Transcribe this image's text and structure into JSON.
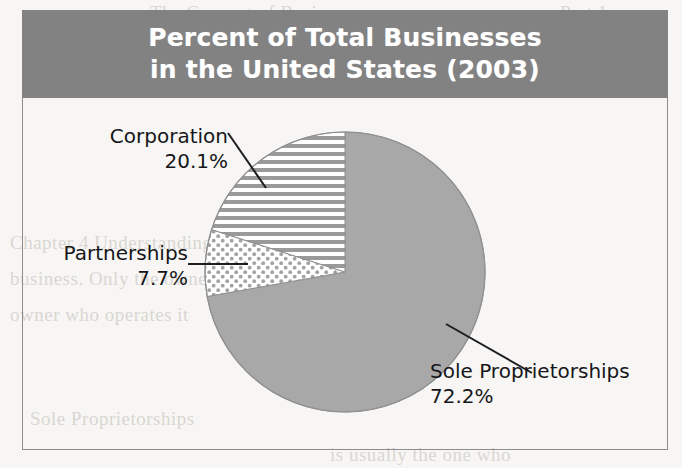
{
  "figure": {
    "title_lines": [
      "Percent of Total Businesses",
      "in the United States (2003)"
    ],
    "colors": {
      "title_bar": "#828282",
      "title_text": "#ffffff",
      "slice_gray": "#a8a8a8",
      "pattern_gray": "#9a9a9a",
      "frame": "#8d8d8d",
      "label_text": "#16161a",
      "paper": "#f7f6f4"
    }
  },
  "chart_data": {
    "type": "pie",
    "title": "Percent of Total Businesses in the United States (2003)",
    "xlabel": "",
    "ylabel": "",
    "unit": "%",
    "start_angle_deg": 0,
    "direction": "clockwise",
    "legend": "callout-labels",
    "grid": false,
    "categories": [
      "Sole Proprietorships",
      "Partnerships",
      "Corporation"
    ],
    "values": [
      72.2,
      7.7,
      20.1
    ],
    "slices": [
      {
        "label": "Sole Proprietorships",
        "value": 72.2,
        "value_text": "72.2%",
        "fill": "solid-gray",
        "color": "#a8a8a8",
        "start_deg": 0,
        "end_deg": 259.92
      },
      {
        "label": "Partnerships",
        "value": 7.7,
        "value_text": "7.7%",
        "fill": "dotted",
        "color": "#9a9a9a",
        "start_deg": 259.92,
        "end_deg": 287.64
      },
      {
        "label": "Corporation",
        "value": 20.1,
        "value_text": "20.1%",
        "fill": "horizontal-stripes",
        "color": "#9a9a9a",
        "start_deg": 287.64,
        "end_deg": 360
      }
    ]
  },
  "labels": {
    "corporation": {
      "name": "Corporation",
      "value": "20.1%"
    },
    "partnerships": {
      "name": "Partnerships",
      "value": "7.7%"
    },
    "sole": {
      "name": "Sole Proprietorships",
      "value": "72.2%"
    }
  },
  "bleed_text": [
    "The Concept of Business",
    "Part 1",
    "Chapter 4   Understanding",
    "business. Only the owner is liable for",
    "owner who operates it",
    "Sole Proprietorships",
    "is usually the one who"
  ]
}
